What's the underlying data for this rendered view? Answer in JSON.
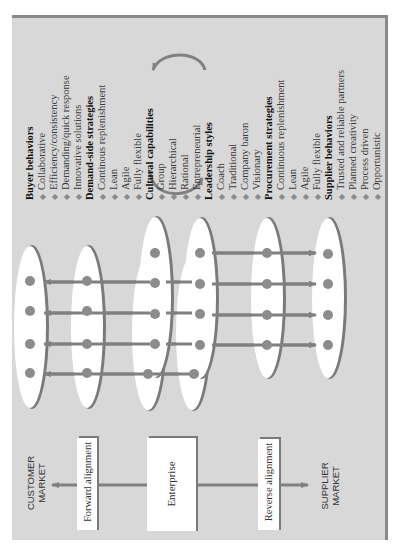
{
  "diagram": {
    "orientation": "rotated -90deg (text reads bottom-to-top)",
    "colors": {
      "panel_bg": "#d8d8d8",
      "panel_border": "#8a8a8a",
      "ellipse_fill": "#ffffff",
      "ellipse_shadow": "#7a7a7a",
      "dot": "#8c8c8c",
      "arrow": "#808080",
      "box_fill": "#ffffff"
    },
    "markets": {
      "customer": [
        "CUSTOMER",
        "MARKET"
      ],
      "supplier": [
        "SUPPLIER",
        "MARKET"
      ]
    },
    "boxes": {
      "forward": "Forward alignment",
      "enterprise": "Enterprise",
      "reverse": "Reverse alignment"
    },
    "lists": [
      {
        "heading": "Buyer behaviors",
        "items": [
          "Collaborative",
          "Efficiency/consistency",
          "Demanding/quick response",
          "Innovative solutions"
        ]
      },
      {
        "heading": "Demand-side strategies",
        "items": [
          "Continous replenishment",
          "Lean",
          "Agile",
          "Fully flexible"
        ]
      },
      {
        "heading": "Cultural capabilities",
        "items": [
          "Group",
          "Hierarchical",
          "Rational",
          "Entrepreneurial"
        ]
      },
      {
        "heading": "Leadership styles",
        "items": [
          "Coach",
          "Traditional",
          "Company baron",
          "Visionary"
        ]
      },
      {
        "heading": "Procurement strategies",
        "items": [
          "Continuous replenishment",
          "Lean",
          "Agile",
          "Fully flexible"
        ]
      },
      {
        "heading": "Supplier behaviors",
        "items": [
          "Trusted and reliable partners",
          "Planned creativity",
          "Process driven",
          "Opportunistic"
        ]
      }
    ],
    "ellipses": [
      {
        "name": "customer-market-ellipse",
        "cx": 30,
        "cy": 327,
        "rx": 17,
        "ry": 82,
        "dots": [
          281,
          311,
          344,
          373
        ]
      },
      {
        "name": "forward-alignment-ellipse",
        "cx": 87,
        "cy": 327,
        "rx": 17,
        "ry": 82,
        "dots": [
          281,
          311,
          344,
          373
        ]
      },
      {
        "name": "enterprise-ellipse-back-1",
        "cx": 148,
        "cy": 333,
        "rx": 17,
        "ry": 78,
        "dots": [
          374
        ]
      },
      {
        "name": "enterprise-ellipse-front-1",
        "cx": 155,
        "cy": 297,
        "rx": 17,
        "ry": 81,
        "dots": [
          253,
          283,
          314,
          344
        ]
      },
      {
        "name": "enterprise-ellipse-back-2",
        "cx": 192,
        "cy": 333,
        "rx": 17,
        "ry": 78,
        "dots": [
          374
        ]
      },
      {
        "name": "enterprise-ellipse-front-2",
        "cx": 200,
        "cy": 298,
        "rx": 17,
        "ry": 81,
        "dots": [
          253,
          284,
          314,
          345
        ]
      },
      {
        "name": "reverse-alignment-ellipse",
        "cx": 267,
        "cy": 298,
        "rx": 17,
        "ry": 81,
        "dots": [
          253,
          284,
          315,
          345
        ]
      },
      {
        "name": "supplier-market-ellipse",
        "cx": 328,
        "cy": 298,
        "rx": 17,
        "ry": 81,
        "dots": [
          254,
          284,
          315,
          345
        ]
      }
    ]
  }
}
